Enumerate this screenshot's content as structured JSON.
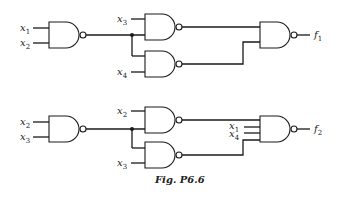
{
  "figure": {
    "caption": "Fig. P6.6",
    "circuit_1": {
      "output_label": "f",
      "output_sub": "1",
      "inputs": [
        {
          "var": "x",
          "sub": "1"
        },
        {
          "var": "x",
          "sub": "2"
        },
        {
          "var": "x",
          "sub": "3"
        },
        {
          "var": "x",
          "sub": "4"
        }
      ],
      "gates": [
        "NAND",
        "NAND",
        "NAND",
        "NAND"
      ]
    },
    "circuit_2": {
      "output_label": "f",
      "output_sub": "2",
      "inputs": [
        {
          "var": "x",
          "sub": "2"
        },
        {
          "var": "x",
          "sub": "3"
        },
        {
          "var": "x",
          "sub": "2"
        },
        {
          "var": "x",
          "sub": "3"
        },
        {
          "var": "x",
          "sub": "1"
        },
        {
          "var": "x",
          "sub": "4"
        }
      ],
      "gates": [
        "NAND",
        "NAND",
        "NAND",
        "NAND"
      ]
    }
  }
}
